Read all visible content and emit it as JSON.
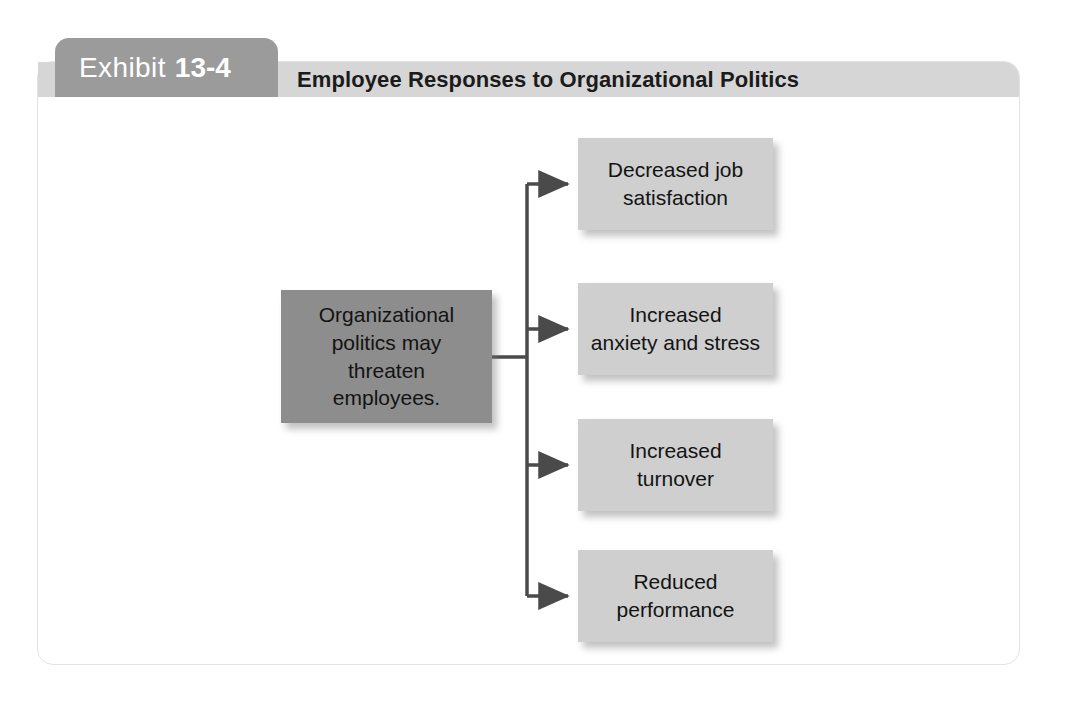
{
  "exhibit": {
    "tab_label": "Exhibit",
    "tab_number": "13-4",
    "title": "Employee Responses to Organizational Politics"
  },
  "diagram": {
    "type": "flowchart",
    "source_node": {
      "label": "Organizational\npolitics may\nthreaten\nemployees.",
      "color": "#8d8d8d"
    },
    "outcome_nodes": [
      {
        "label": "Decreased job\nsatisfaction",
        "color": "#cfcfcf"
      },
      {
        "label": "Increased\nanxiety and stress",
        "color": "#cfcfcf"
      },
      {
        "label": "Increased\nturnover",
        "color": "#cfcfcf"
      },
      {
        "label": "Reduced\nperformance",
        "color": "#cfcfcf"
      }
    ],
    "connector_color": "#4a4a4a"
  },
  "colors": {
    "tab_background": "#9b9b9b",
    "header_background": "#d6d6d6",
    "card_background": "#ffffff",
    "card_border": "#e3e3e3",
    "text_dark": "#131313",
    "text_light": "#ffffff"
  }
}
